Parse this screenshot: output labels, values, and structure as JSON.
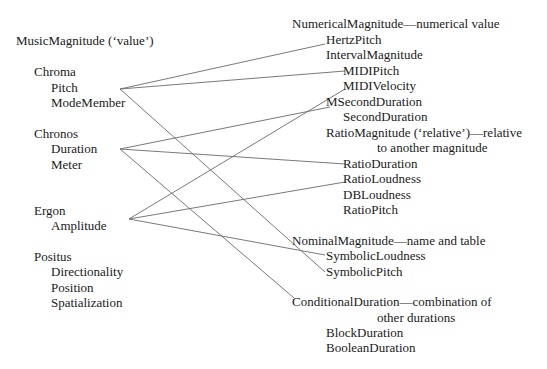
{
  "left": {
    "root": "MusicMagnitude (‘value’)",
    "groups": [
      {
        "name": "Chroma",
        "items": [
          "Pitch",
          "ModeMember"
        ]
      },
      {
        "name": "Chronos",
        "items": [
          "Duration",
          "Meter"
        ]
      },
      {
        "name": "Ergon",
        "items": [
          "Amplitude"
        ]
      },
      {
        "name": "Positus",
        "items": [
          "Directionality",
          "Position",
          "Spatialization"
        ]
      }
    ]
  },
  "right": {
    "numerical": {
      "title": "NumericalMagnitude—numerical value",
      "items": [
        "HertzPitch",
        "IntervalMagnitude",
        "MIDIPitch",
        "MIDIVelocity",
        "MSecondDuration",
        "SecondDuration"
      ]
    },
    "ratio": {
      "title_line1": "RatioMagnitude (‘relative’)—relative",
      "title_line2": "to another magnitude",
      "items": [
        "RatioDuration",
        "RatioLoudness",
        "DBLoudness",
        "RatioPitch"
      ]
    },
    "nominal": {
      "title": "NominalMagnitude—name and table",
      "items": [
        "SymbolicLoudness",
        "SymbolicPitch"
      ]
    },
    "conditional": {
      "title_line1": "ConditionalDuration—combination of",
      "title_line2": "other durations",
      "items": [
        "BlockDuration",
        "BooleanDuration"
      ]
    }
  },
  "links": [
    {
      "from": "Pitch",
      "to": "HertzPitch"
    },
    {
      "from": "Pitch",
      "to": "MIDIPitch"
    },
    {
      "from": "Pitch",
      "to": "SymbolicPitch"
    },
    {
      "from": "Duration",
      "to": "MSecondDuration"
    },
    {
      "from": "Duration",
      "to": "RatioDuration"
    },
    {
      "from": "Duration",
      "to": "ConditionalDuration"
    },
    {
      "from": "Amplitude",
      "to": "MIDIVelocity"
    },
    {
      "from": "Amplitude",
      "to": "RatioLoudness"
    },
    {
      "from": "Amplitude",
      "to": "SymbolicLoudness"
    }
  ]
}
